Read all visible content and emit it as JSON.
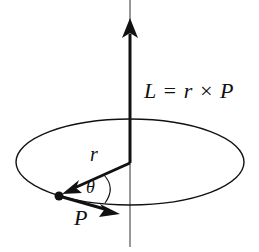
{
  "diagram": {
    "equation": "L = r × P",
    "labels": {
      "radius": "r",
      "angle": "θ",
      "momentum": "P"
    },
    "elements": [
      {
        "id": "axis",
        "type": "thin vertical line",
        "description": "rotation axis"
      },
      {
        "id": "L-vector",
        "type": "thick arrow",
        "direction": "up",
        "label": "L = r × P"
      },
      {
        "id": "orbit",
        "type": "ellipse",
        "description": "circular orbit in perspective"
      },
      {
        "id": "r-vector",
        "type": "thick arrow",
        "from": "center",
        "to": "particle",
        "label": "r"
      },
      {
        "id": "particle",
        "type": "dot"
      },
      {
        "id": "P-vector",
        "type": "thick arrow",
        "direction": "tangent to orbit",
        "label": "P"
      },
      {
        "id": "angle-arc",
        "type": "arc",
        "between": [
          "r",
          "P"
        ],
        "label": "θ"
      }
    ],
    "colors": {
      "stroke": "#111111",
      "background": "#ffffff"
    }
  }
}
